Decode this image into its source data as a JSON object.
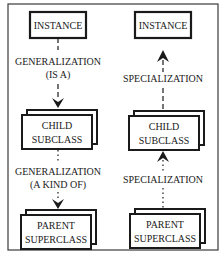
{
  "diagram": {
    "left": {
      "instance": "INSTANCE",
      "arrow1_label_line1": "GENERALIZATION",
      "arrow1_label_line2": "(IS A)",
      "child_line1": "CHILD",
      "child_line2": "SUBCLASS",
      "arrow2_label_line1": "GENERALIZATION",
      "arrow2_label_line2": "(A KIND OF)",
      "parent_line1": "PARENT",
      "parent_line2": "SUPERCLASS"
    },
    "right": {
      "instance": "INSTANCE",
      "arrow1_label": "SPECIALIZATION",
      "child_line1": "CHILD",
      "child_line2": "SUBCLASS",
      "arrow2_label": "SPECIALIZATION",
      "parent_line1": "PARENT",
      "parent_line2": "SUPERCLASS"
    },
    "colors": {
      "ink": "#1a1a1a",
      "frame": "#3a3a3a",
      "background": "#ffffff"
    }
  }
}
